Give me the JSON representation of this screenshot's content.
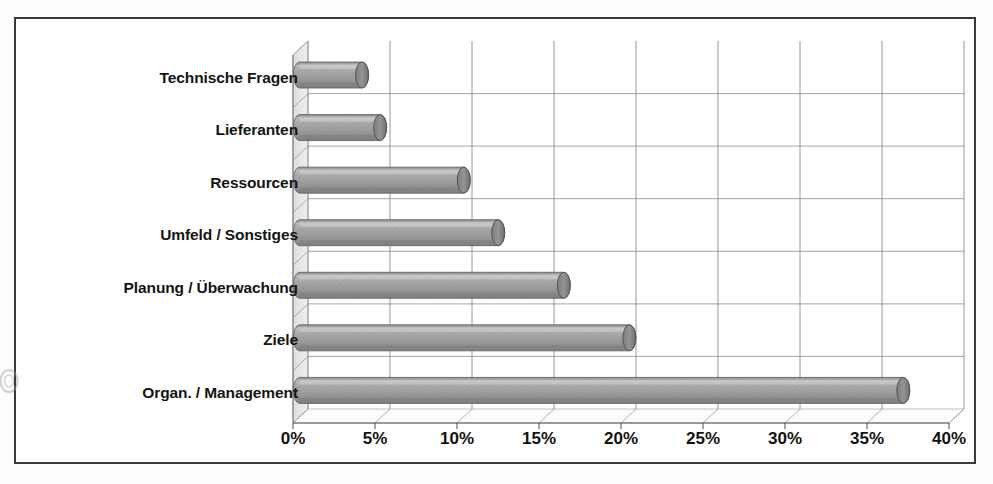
{
  "chart_data": {
    "type": "bar",
    "orientation": "horizontal",
    "title": "",
    "subtitle": "",
    "xlabel": "",
    "ylabel": "",
    "categories": [
      "Technische Fragen",
      "Lieferanten",
      "Ressourcen",
      "Umfeld / Sonstiges",
      "Planung / Überwachung",
      "Ziele",
      "Organ. / Management"
    ],
    "values": [
      3.8,
      4.9,
      10.0,
      12.1,
      16.1,
      20.1,
      36.8
    ],
    "value_unit": "%",
    "xlim": [
      0,
      40
    ],
    "xticks": [
      0,
      5,
      10,
      15,
      20,
      25,
      30,
      35,
      40
    ],
    "xtick_labels": [
      "0%",
      "5%",
      "10%",
      "15%",
      "20%",
      "25%",
      "30%",
      "35%",
      "40%"
    ],
    "grid": "vertical",
    "legend": "none",
    "series": [
      {
        "name": "Anteil",
        "values": [
          3.8,
          4.9,
          10.0,
          12.1,
          16.1,
          20.1,
          36.8
        ]
      }
    ],
    "style": {
      "bar_shape": "cylinder",
      "three_d": true,
      "bar_fill": "#9d9d9d",
      "bar_highlight": "#cccccc",
      "bar_shadow": "#7a7a7a",
      "bar_edge": "#4f4f4f",
      "plot_border": "#555555",
      "gridline_color": "#808080",
      "wall_color": "#ffffff",
      "side_wall_color": "#e4e4e4",
      "floor_color": "#fbfbfb",
      "frame_color": "#3a3a3a",
      "text_color": "#111111"
    }
  },
  "frame": {
    "border_color": "#3a3a3a"
  }
}
